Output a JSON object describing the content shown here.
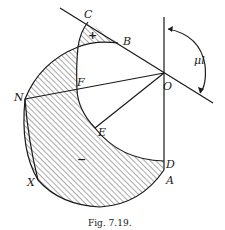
{
  "figure": {
    "caption": "Fig. 7.19.",
    "angle_label": "μl",
    "region_signs": {
      "upper": "+",
      "lower": "−"
    },
    "points": {
      "C": "C",
      "B": "B",
      "O": "O",
      "F": "F",
      "N": "N",
      "E": "E",
      "D": "D",
      "A": "A",
      "X": "X"
    }
  }
}
